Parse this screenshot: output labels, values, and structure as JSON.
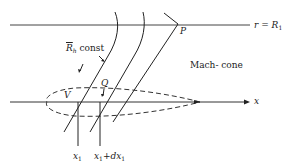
{
  "diagram": {
    "type": "aerodynamics-schematic",
    "colors": {
      "ink": "#222222",
      "background": "#ffffff"
    },
    "labels": {
      "radius_line": {
        "lhs": "r",
        "eq": "=",
        "rhs": "R",
        "rhs_sub": "1"
      },
      "axis_x": "x",
      "rh_const": {
        "symbol": "R",
        "sub": "h",
        "text": "const"
      },
      "point_P": "P",
      "point_Q": "Q",
      "volume_V": "V",
      "mach_cone": "Mach- cone",
      "x1": {
        "symbol": "x",
        "sub": "1"
      },
      "x1_dx1": {
        "symbol": "x",
        "sub": "1",
        "plus": "+",
        "d": "dx",
        "dsub": "1"
      }
    },
    "elements": [
      "horizontal line r = R1",
      "x-axis with arrow",
      "dashed slender body outline",
      "two curved Rh-const lines",
      "Mach cone line through P",
      "vertical lines at x1 and x1+dx1"
    ]
  }
}
